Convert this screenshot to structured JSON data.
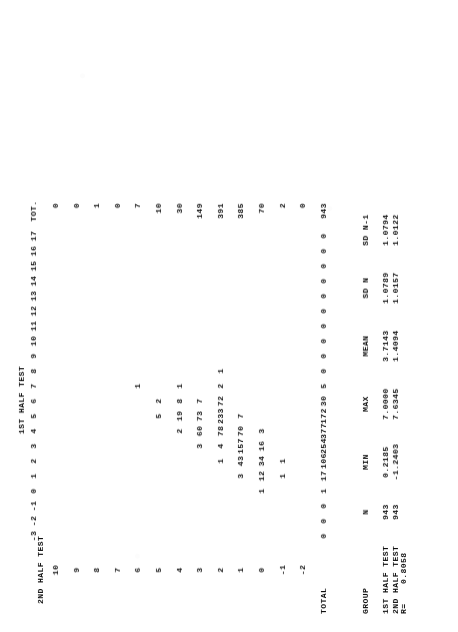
{
  "report": {
    "row_axis_title": "2ND HALF TEST",
    "col_axis_title": "1ST HALF TEST",
    "total_label": "TOT.",
    "grand_total_label": "TOTAL",
    "grand_total": "943"
  },
  "crosstab": {
    "col_headers": [
      "-3",
      "-2",
      "-1",
      "0",
      "1",
      "2",
      "3",
      "4",
      "5",
      "6",
      "7",
      "8",
      "9",
      "10",
      "11",
      "12",
      "13",
      "14",
      "15",
      "16",
      "17"
    ],
    "row_headers": [
      "10",
      "9",
      "8",
      "7",
      "6",
      "5",
      "4",
      "3",
      "2",
      "1",
      "0",
      "-1",
      "-2"
    ],
    "row_totals": [
      "0",
      "0",
      "1",
      "0",
      "7",
      "10",
      "30",
      "149",
      "391",
      "385",
      "70",
      "2",
      "0"
    ],
    "col_totals": [
      "0",
      "0",
      "0",
      "1",
      "17",
      "106",
      "254",
      "377",
      "172",
      "30",
      "5",
      "0",
      "0",
      "0",
      "0",
      "0",
      "0",
      "0",
      "0",
      "0",
      "0"
    ],
    "cells": [
      {
        "row": "10",
        "col": "",
        "v": ""
      },
      {
        "row": "6",
        "col": "7",
        "v": "1"
      },
      {
        "row": "5",
        "col": "5",
        "v": "5"
      },
      {
        "row": "5",
        "col": "6",
        "v": "2"
      },
      {
        "row": "4",
        "col": "4",
        "v": "2"
      },
      {
        "row": "4",
        "col": "5",
        "v": "19"
      },
      {
        "row": "4",
        "col": "6",
        "v": "8"
      },
      {
        "row": "4",
        "col": "7",
        "v": "1"
      },
      {
        "row": "3",
        "col": "3",
        "v": "3"
      },
      {
        "row": "3",
        "col": "4",
        "v": "60"
      },
      {
        "row": "3",
        "col": "5",
        "v": "73"
      },
      {
        "row": "3",
        "col": "6",
        "v": "7"
      },
      {
        "row": "2",
        "col": "2",
        "v": "1"
      },
      {
        "row": "2",
        "col": "3",
        "v": "4"
      },
      {
        "row": "2",
        "col": "4",
        "v": "78"
      },
      {
        "row": "2",
        "col": "5",
        "v": "233"
      },
      {
        "row": "2",
        "col": "6",
        "v": "72"
      },
      {
        "row": "2",
        "col": "7",
        "v": "2"
      },
      {
        "row": "2",
        "col": "8",
        "v": "1"
      },
      {
        "row": "1",
        "col": "1",
        "v": "3"
      },
      {
        "row": "1",
        "col": "2",
        "v": "43"
      },
      {
        "row": "1",
        "col": "3",
        "v": "157"
      },
      {
        "row": "1",
        "col": "4",
        "v": "70"
      },
      {
        "row": "1",
        "col": "5",
        "v": "7"
      },
      {
        "row": "0",
        "col": "0",
        "v": "1"
      },
      {
        "row": "0",
        "col": "1",
        "v": "12"
      },
      {
        "row": "0",
        "col": "2",
        "v": "34"
      },
      {
        "row": "0",
        "col": "3",
        "v": "16"
      },
      {
        "row": "0",
        "col": "4",
        "v": "3"
      },
      {
        "row": "-1",
        "col": "1",
        "v": "1"
      },
      {
        "row": "-1",
        "col": "2",
        "v": "1"
      }
    ]
  },
  "stats": {
    "headers": [
      "GROUP",
      "N",
      "MIN",
      "MAX",
      "MEAN",
      "SD N",
      "SD N-1"
    ],
    "rows": [
      {
        "group": "1ST HALF TEST",
        "n": "943",
        "min": "0.2185",
        "max": "7.0000",
        "mean": "3.7143",
        "sd_n": "1.0789",
        "sd_n1": "1.0794"
      },
      {
        "group": "2ND HALF TEST",
        "n": "943",
        "min": "-1.2403",
        "max": "7.6345",
        "mean": "1.4094",
        "sd_n": "1.0157",
        "sd_n1": "1.0122"
      }
    ],
    "correlation_label": "R=",
    "correlation_value": "0.8058"
  }
}
